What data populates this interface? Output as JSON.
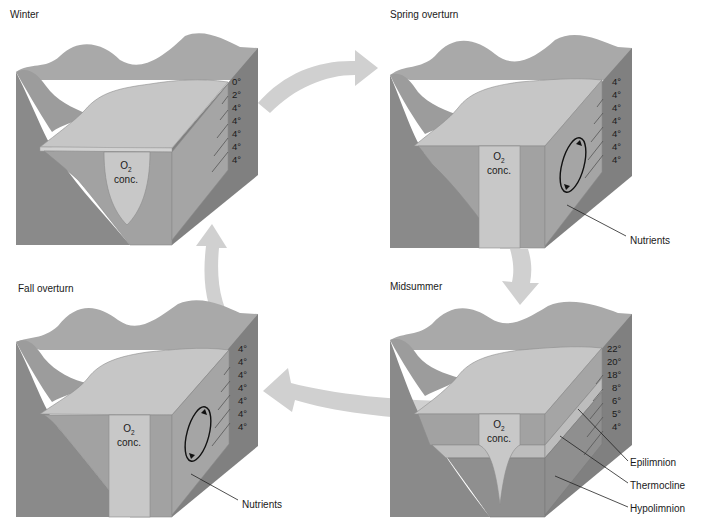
{
  "figure": {
    "type": "lake seasonal turnover diagram",
    "cycle_order": [
      "Winter",
      "Spring overturn",
      "Midsummer",
      "Fall overturn"
    ]
  },
  "panels": {
    "winter": {
      "title": "Winter",
      "o2_label": "O",
      "o2_sub": "2",
      "o2_label2": "conc.",
      "temperatures": [
        "0°",
        "2°",
        "4°",
        "4°",
        "4°",
        "4°",
        "4°"
      ],
      "o2_profile": "narrowing-with-depth"
    },
    "spring": {
      "title": "Spring overturn",
      "o2_label": "O",
      "o2_sub": "2",
      "o2_label2": "conc.",
      "temperatures": [
        "4°",
        "4°",
        "4°",
        "4°",
        "4°",
        "4°",
        "4°"
      ],
      "circulation": "mixing",
      "callouts": [
        "Nutrients"
      ]
    },
    "midsummer": {
      "title": "Midsummer",
      "o2_label": "O",
      "o2_sub": "2",
      "o2_label2": "conc.",
      "temperatures": [
        "22°",
        "20°",
        "18°",
        "8°",
        "6°",
        "5°",
        "4°"
      ],
      "layers": [
        "Epilimnion",
        "Thermocline",
        "Hypolimnion"
      ]
    },
    "fall": {
      "title": "Fall overturn",
      "o2_label": "O",
      "o2_sub": "2",
      "o2_label2": "conc.",
      "temperatures": [
        "4°",
        "4°",
        "4°",
        "4°",
        "4°",
        "4°",
        "4°"
      ],
      "circulation": "mixing",
      "callouts": [
        "Nutrients"
      ]
    }
  },
  "arrows": [
    {
      "from": "Winter",
      "to": "Spring overturn"
    },
    {
      "from": "Spring overturn",
      "to": "Midsummer"
    },
    {
      "from": "Midsummer",
      "to": "Fall overturn"
    },
    {
      "from": "Fall overturn",
      "to": "Winter"
    }
  ]
}
